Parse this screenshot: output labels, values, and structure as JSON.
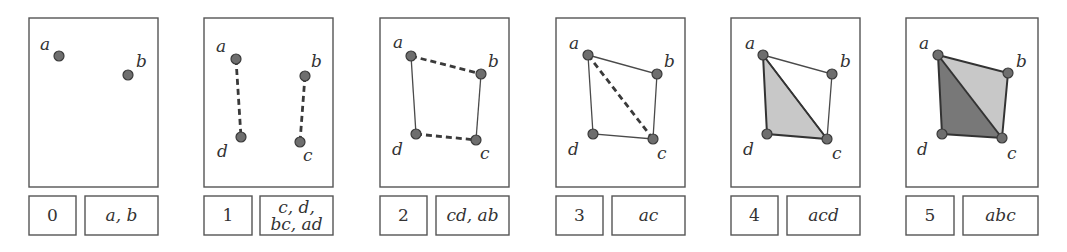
{
  "colors": {
    "frame": "#555555",
    "point": "#6e6e6e",
    "fill_light": "#c8c8c8",
    "fill_dark": "#787878"
  },
  "vertex_labels": {
    "a": "a",
    "b": "b",
    "c": "c",
    "d": "d"
  },
  "panels": [
    {
      "step": "0",
      "caption": [
        "a, b"
      ]
    },
    {
      "step": "1",
      "caption": [
        "c, d,",
        "bc, ad"
      ]
    },
    {
      "step": "2",
      "caption": [
        "cd, ab"
      ]
    },
    {
      "step": "3",
      "caption": [
        "ac"
      ]
    },
    {
      "step": "4",
      "caption": [
        "acd"
      ]
    },
    {
      "step": "5",
      "caption": [
        "abc"
      ]
    }
  ]
}
